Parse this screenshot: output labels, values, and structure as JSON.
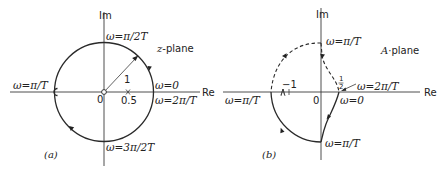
{
  "panel_a": {
    "caption": "(a)",
    "plane_label": "z-plane",
    "axis_im": "Im",
    "axis_re": "Re",
    "origin": "0",
    "radius_label": "1",
    "pole_label": "0.5",
    "top_label": "ω=π/2T",
    "bottom_label": "ω=3π/2T",
    "left_label": "ω=π/T",
    "right_label_upper": "ω=0",
    "right_label_lower": "ω=2π/T"
  },
  "panel_b": {
    "caption": "(b)",
    "plane_label": "A-plane",
    "axis_im": "Im",
    "axis_re": "Re",
    "origin": "0",
    "minus_one": "−1",
    "half_num": "1",
    "half_den": "2",
    "top_label": "ω=π/T",
    "bottom_label": "ω=π/T",
    "left_label": "ω=π/T",
    "right_label_lower": "ω=0",
    "right_label_arrow": "ω=2π/T"
  }
}
